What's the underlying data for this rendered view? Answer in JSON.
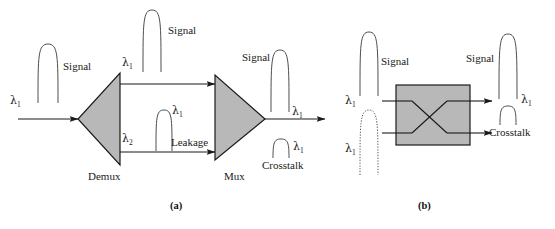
{
  "figure": {
    "panels": [
      {
        "id": "a",
        "caption": "(a)",
        "description": "Demultiplexer and multiplexer chain showing signal leakage producing crosstalk",
        "components": [
          {
            "name": "Demux",
            "label": "Demux",
            "shape": "triangle-left",
            "fill": "#b8b8b8"
          },
          {
            "name": "Mux",
            "label": "Mux",
            "shape": "triangle-right",
            "fill": "#b8b8b8"
          }
        ],
        "labels": {
          "input_wavelength": "λ",
          "input_wavelength_sub": "1",
          "input_signal": "Signal",
          "demux_name": "Demux",
          "demux_out_top_wavelength": "λ",
          "demux_out_top_sub": "1",
          "demux_out_bottom_wavelength": "λ",
          "demux_out_bottom_sub": "2",
          "top_signal": "Signal",
          "leakage": "Leakage",
          "leakage_wavelength": "λ",
          "leakage_sub": "1",
          "mux_name": "Mux",
          "output_signal": "Signal",
          "output_signal_wavelength": "λ",
          "output_signal_sub": "1",
          "crosstalk": "Crosstalk",
          "crosstalk_wavelength": "λ",
          "crosstalk_sub": "1"
        }
      },
      {
        "id": "b",
        "caption": "(b)",
        "description": "Optical crossconnect switch box with crossing paths producing crosstalk",
        "components": [
          {
            "name": "switch-box",
            "label": "",
            "shape": "rectangle",
            "fill": "#b8b8b8"
          }
        ],
        "labels": {
          "input_top_wavelength": "λ",
          "input_top_sub": "1",
          "input_bottom_wavelength": "λ",
          "input_bottom_sub": "1",
          "input_signal": "Signal",
          "output_signal": "Signal",
          "output_signal_wavelength": "λ",
          "output_signal_sub": "1",
          "crosstalk": "Crosstalk"
        }
      }
    ],
    "colors": {
      "component_fill": "#b8b8b8",
      "stroke": "#1a1a1a",
      "background": "#ffffff",
      "text": "#1a1a1a"
    }
  }
}
